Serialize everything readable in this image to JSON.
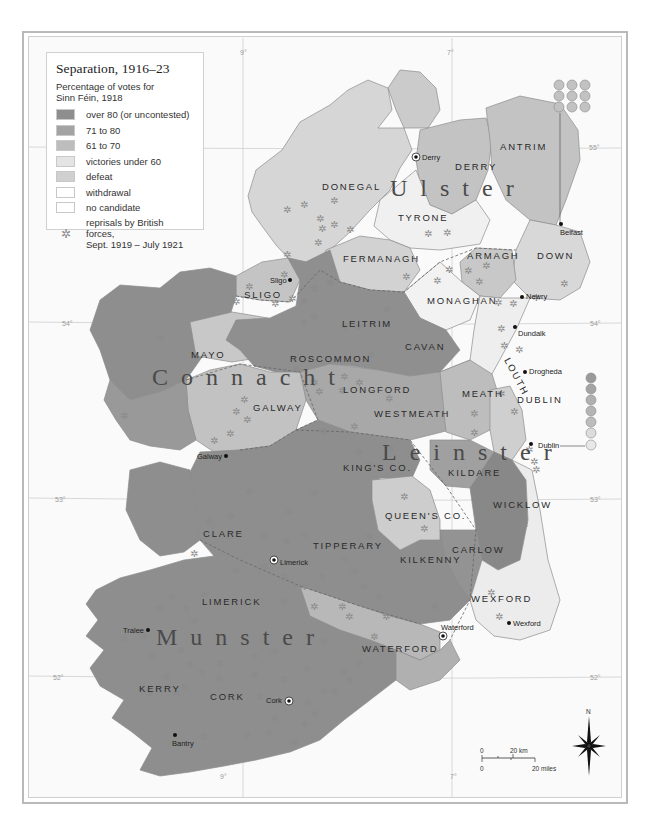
{
  "legend": {
    "title": "Separation, 1916–23",
    "subtitle_line1": "Percentage of votes for",
    "subtitle_line2": "Sinn Féin, 1918",
    "items": [
      {
        "label": "over 80 (or uncontested)",
        "color": "#8e8e8e"
      },
      {
        "label": "71 to 80",
        "color": "#a3a3a3"
      },
      {
        "label": "61 to 70",
        "color": "#bdbdbd"
      },
      {
        "label": "victories under 60",
        "color": "#e4e4e4"
      },
      {
        "label": "defeat",
        "color": "#d0d0d0"
      },
      {
        "label": "withdrawal",
        "color": "#ffffff"
      },
      {
        "label": "no candidate",
        "color": "#ffffff"
      }
    ],
    "reprisal_icon": "star-asterisk-icon",
    "reprisal_line1": "reprisals by British",
    "reprisal_line2": "forces,",
    "reprisal_line3": "Sept. 1919 – July 1921"
  },
  "provinces": {
    "ulster": "Ulster",
    "connacht": "Connacht",
    "leinster": "Leinster",
    "munster": "Munster"
  },
  "counties": {
    "antrim": "ANTRIM",
    "derry": "DERRY",
    "donegal": "DONEGAL",
    "tyrone": "TYRONE",
    "fermanagh": "FERMANAGH",
    "armagh": "ARMAGH",
    "down": "DOWN",
    "monaghan": "MONAGHAN",
    "cavan": "CAVAN",
    "sligo": "SLIGO",
    "leitrim": "LEITRIM",
    "mayo": "MAYO",
    "roscommon": "ROSCOMMON",
    "longford": "LONGFORD",
    "louth": "LOUTH",
    "galway": "GALWAY",
    "westmeath": "WESTMEATH",
    "meath": "MEATH",
    "dublin": "DUBLIN",
    "kings_co": "KING'S CO.",
    "kildare": "KILDARE",
    "wicklow": "WICKLOW",
    "queens_co": "QUEEN'S CO.",
    "clare": "CLARE",
    "tipperary": "TIPPERARY",
    "kilkenny": "KILKENNY",
    "carlow": "CARLOW",
    "limerick": "LIMERICK",
    "wexford": "WEXFORD",
    "waterford": "WATERFORD",
    "kerry": "KERRY",
    "cork": "CORK"
  },
  "towns": {
    "derry": "Derry",
    "belfast": "Belfast",
    "sligo": "Sligo",
    "newry": "Newry",
    "dundalk": "Dundalk",
    "drogheda": "Drogheda",
    "dublin": "Dublin",
    "galway": "Galway",
    "limerick": "Limerick",
    "tralee": "Tralee",
    "waterford": "Waterford",
    "wexford": "Wexford",
    "cork": "Cork",
    "bantry": "Bantry"
  },
  "graticule": {
    "lon_9": "9°",
    "lon_7": "7°",
    "lat_55": "55°",
    "lat_54": "54°",
    "lat_53": "53°",
    "lat_52": "52°"
  },
  "scale_bar": {
    "km_zero": "0",
    "km_label": "20 km",
    "mi_zero": "0",
    "mi_label": "20 miles"
  },
  "compass": {
    "north_label": "N"
  },
  "circle_stacks": {
    "belfast_count": 9,
    "dublin_count": 7
  }
}
